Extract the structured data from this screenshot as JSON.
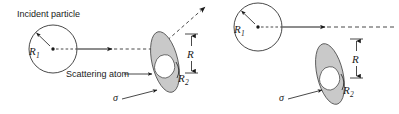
{
  "figure": {
    "background_color": "#ffffff",
    "line_color": "#1a1a1a",
    "disk_fill_color": "#c9c9c9",
    "core_fill_color": "#ffffff",
    "width": 399,
    "height": 114
  },
  "panels": [
    {
      "id": "left",
      "caption": "scattering occurs",
      "labels": {
        "incident_particle": "Incident particle",
        "scattering_atom": "Scattering atom",
        "radius_particle": "R",
        "radius_particle_sub": "1",
        "radius_atom": "R",
        "radius_atom_sub": "2",
        "impact_radius": "R",
        "cross_section": "σ"
      },
      "trajectory": {
        "incoming": "solid-with-arrowhead",
        "entering": "dashed",
        "outgoing": "dashed-diagonal-arrow",
        "deflected": true
      }
    },
    {
      "id": "right",
      "caption": "no scattering",
      "labels": {
        "radius_particle": "R",
        "radius_particle_sub": "1",
        "radius_atom": "R",
        "radius_atom_sub": "2",
        "impact_radius": "R",
        "cross_section": "σ"
      },
      "trajectory": {
        "incoming": "solid-with-arrowhead",
        "entering": "dashed",
        "outgoing": "dashed-straight",
        "deflected": false
      }
    }
  ]
}
